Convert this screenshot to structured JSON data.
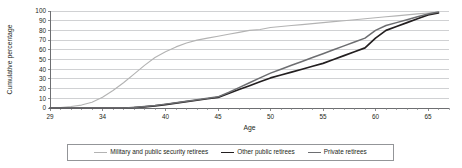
{
  "chart_data": {
    "type": "line",
    "title": "",
    "xlabel": "Age",
    "ylabel": "Cumulative percentage",
    "xlim": [
      29,
      67
    ],
    "ylim": [
      0,
      100
    ],
    "grid": true,
    "legend_position": "bottom",
    "xticks": [
      29,
      34,
      40,
      45,
      50,
      55,
      60,
      65
    ],
    "xtick_labels": [
      "29",
      "34",
      "40",
      "45",
      "50",
      "55",
      "60",
      "65"
    ],
    "yticks": [
      0,
      10,
      20,
      30,
      40,
      50,
      60,
      70,
      80,
      90,
      100
    ],
    "ytick_labels": [
      "0",
      "10",
      "20",
      "30",
      "40",
      "50",
      "60",
      "70",
      "80",
      "90",
      "100"
    ],
    "x": [
      29,
      30,
      31,
      32,
      33,
      34,
      35,
      36,
      37,
      38,
      39,
      40,
      41,
      42,
      43,
      44,
      45,
      46,
      47,
      48,
      49,
      50,
      51,
      52,
      53,
      54,
      55,
      56,
      57,
      58,
      59,
      60,
      61,
      62,
      63,
      64,
      65,
      66
    ],
    "series": [
      {
        "name": "Military and public security retirees",
        "color": "#b3b3b3",
        "width": 1.1,
        "values": [
          0,
          0.5,
          1.5,
          3,
          6,
          11,
          18,
          26,
          35,
          44,
          52,
          58,
          63,
          67,
          70,
          72,
          74,
          76,
          78,
          80,
          81,
          83,
          84,
          85,
          86,
          87,
          88,
          89,
          90,
          91,
          92,
          93,
          94,
          95,
          96,
          97,
          98,
          99
        ]
      },
      {
        "name": "Other public retirees",
        "color": "#231f20",
        "width": 1.7,
        "values": [
          0,
          0,
          0,
          0,
          0,
          0,
          0,
          0,
          0.5,
          1.2,
          2.2,
          3.5,
          5,
          6.5,
          8,
          9.5,
          11,
          15,
          19,
          23,
          27,
          31,
          34,
          37,
          40,
          43,
          46,
          50,
          54,
          58,
          62,
          72,
          80,
          84,
          88,
          92,
          96,
          98
        ]
      },
      {
        "name": "Private retirees",
        "color": "#6d6e71",
        "width": 1.5,
        "values": [
          0,
          0,
          0,
          0,
          0,
          0,
          0,
          0,
          0.6,
          1.5,
          2.6,
          4,
          5.5,
          7,
          8.5,
          10,
          11.5,
          16,
          21,
          26,
          31,
          36,
          40,
          44,
          48,
          52,
          56,
          60,
          64,
          68,
          72,
          80,
          85,
          88,
          91,
          94,
          97,
          99
        ]
      }
    ]
  },
  "legend": {
    "entries": [
      {
        "label": "Military and public security retirees"
      },
      {
        "label": "Other public retirees"
      },
      {
        "label": "Private retirees"
      }
    ]
  }
}
